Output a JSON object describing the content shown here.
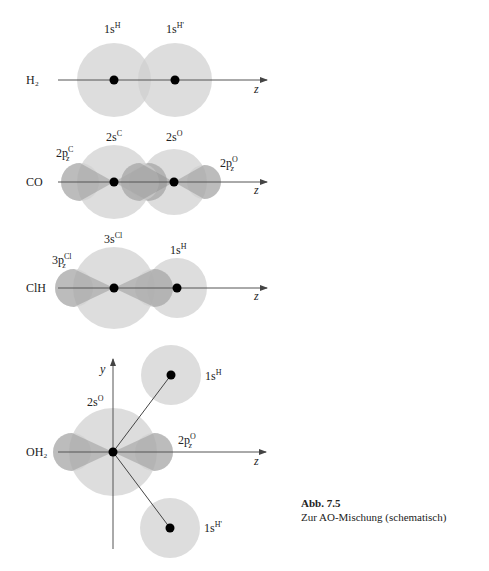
{
  "figure": {
    "number": "Abb. 7.5",
    "caption": "Zur AO-Mischung (schematisch)"
  },
  "colors": {
    "orbital_light": "#dcdcdc",
    "orbital_dark": "#a8a8a8",
    "axis": "#555555",
    "nucleus": "#000000"
  },
  "panels": [
    {
      "molecule": "H₂",
      "axis_label": "z",
      "orbitals": [
        {
          "base": "1s",
          "sup": "H"
        },
        {
          "base": "1s",
          "sup": "H'"
        }
      ]
    },
    {
      "molecule": "CO",
      "axis_label": "z",
      "orbitals": [
        {
          "base": "2s",
          "sup": "C"
        },
        {
          "base": "2p",
          "sub": "z",
          "sup": "C"
        },
        {
          "base": "2s",
          "sup": "O"
        },
        {
          "base": "2p",
          "sub": "z",
          "sup": "O"
        }
      ]
    },
    {
      "molecule": "ClH",
      "axis_label": "z",
      "orbitals": [
        {
          "base": "3s",
          "sup": "Cl"
        },
        {
          "base": "3p",
          "sub": "z",
          "sup": "Cl"
        },
        {
          "base": "1s",
          "sup": "H"
        }
      ]
    },
    {
      "molecule": "OH₂",
      "axis_label": "z",
      "axis_label_y": "y",
      "orbitals": [
        {
          "base": "2s",
          "sup": "O"
        },
        {
          "base": "2p",
          "sub": "z",
          "sup": "O"
        },
        {
          "base": "1s",
          "sup": "H"
        },
        {
          "base": "1s",
          "sup": "H'"
        }
      ]
    }
  ]
}
